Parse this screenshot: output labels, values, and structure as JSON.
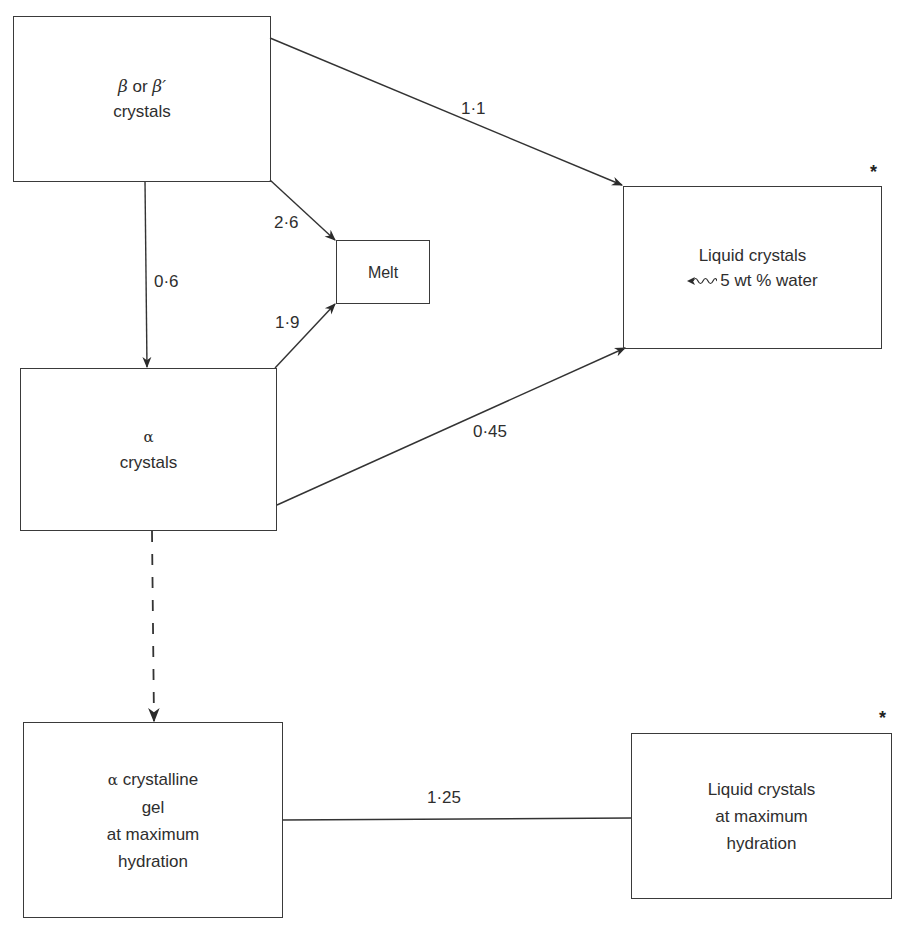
{
  "diagram": {
    "nodes": {
      "beta_crystals": {
        "line1_greek_a": "β",
        "line1_mid": " or ",
        "line1_greek_b": "β′",
        "line2": "crystals"
      },
      "melt": {
        "label": "Melt"
      },
      "liquid_crystals_low_water": {
        "line1": "Liquid crystals",
        "line2": "5 wt % water",
        "marker": "*"
      },
      "alpha_crystals": {
        "line1": "α",
        "line2": "crystals"
      },
      "alpha_gel": {
        "line1_greek": "α",
        "line1_text": " crystalline",
        "line2": "gel",
        "line3": "at maximum",
        "line4": "hydration"
      },
      "liquid_crystals_max_hydration": {
        "line1": "Liquid crystals",
        "line2": "at maximum",
        "line3": "hydration",
        "marker": "*"
      }
    },
    "edges": [
      {
        "from": "beta_crystals",
        "to": "liquid_crystals_low_water",
        "label": "1·1",
        "style": "solid-arrow"
      },
      {
        "from": "beta_crystals",
        "to": "melt",
        "label": "2·6",
        "style": "solid-arrow"
      },
      {
        "from": "beta_crystals",
        "to": "alpha_crystals",
        "label": "0·6",
        "style": "solid-arrow"
      },
      {
        "from": "alpha_crystals",
        "to": "melt",
        "label": "1·9",
        "style": "solid-arrow"
      },
      {
        "from": "alpha_crystals",
        "to": "liquid_crystals_low_water",
        "label": "0·45",
        "style": "solid-arrow"
      },
      {
        "from": "alpha_crystals",
        "to": "alpha_gel",
        "label": "",
        "style": "dashed-arrow"
      },
      {
        "from": "alpha_gel",
        "to": "liquid_crystals_max_hydration",
        "label": "1·25",
        "style": "solid-line"
      }
    ]
  }
}
